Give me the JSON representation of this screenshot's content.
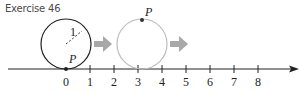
{
  "title": "Exercise 46",
  "number_line": {
    "ticks": [
      "0",
      "1",
      "2",
      "3",
      "4",
      "5",
      "6",
      "7",
      "8"
    ],
    "origin_x": 66,
    "spacing": 24,
    "y": 69,
    "arrow_tip_x": 299
  },
  "circle1": {
    "radius_label": "1",
    "point_label": "P",
    "stroke": "#222222"
  },
  "circle2": {
    "point_label": "P",
    "stroke": "#bdbdbd"
  },
  "arrows": {
    "color": "#a8a8a8"
  },
  "colors": {
    "axis": "#222222",
    "text": "#4a4a4a"
  }
}
